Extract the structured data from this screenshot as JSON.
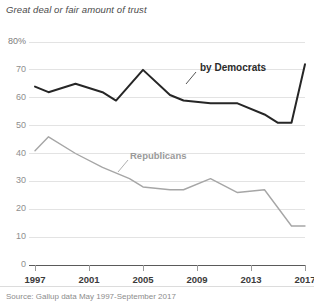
{
  "chart_data": {
    "type": "line",
    "title": "Great deal or fair amount of trust",
    "subtitle": "",
    "xlabel": "",
    "ylabel": "",
    "source": "Source: Gallup data May 1997-September 2017",
    "grid": true,
    "legend_position": "inline-annotation",
    "xlim": [
      1997,
      2017
    ],
    "ylim": [
      0,
      80
    ],
    "ytick_labels": [
      "80%",
      "70",
      "60",
      "50",
      "40",
      "30",
      "20",
      "10",
      "0"
    ],
    "yticks": [
      80,
      70,
      60,
      50,
      40,
      30,
      20,
      10,
      0
    ],
    "xtick_labels": [
      "1997",
      "2001",
      "2005",
      "2009",
      "2013",
      "2017"
    ],
    "xticks": [
      1997,
      2001,
      2005,
      2009,
      2013,
      2017
    ],
    "series": [
      {
        "name": "by Democrats",
        "color": "#262626",
        "x": [
          1997,
          1998,
          2000,
          2002,
          2003,
          2005,
          2007,
          2008,
          2010,
          2012,
          2014,
          2015,
          2016,
          2017
        ],
        "values": [
          64,
          62,
          65,
          62,
          59,
          70,
          61,
          59,
          58,
          58,
          54,
          51,
          51,
          72
        ]
      },
      {
        "name": "Republicans",
        "color": "#a6a6a6",
        "x": [
          1997,
          1998,
          2000,
          2002,
          2004,
          2005,
          2007,
          2008,
          2010,
          2012,
          2014,
          2016,
          2017
        ],
        "values": [
          41,
          46,
          40,
          35,
          31,
          28,
          27,
          27,
          31,
          26,
          27,
          14,
          14
        ]
      }
    ]
  },
  "labels": {
    "democrats": "by Democrats",
    "republicans": "Republicans"
  }
}
